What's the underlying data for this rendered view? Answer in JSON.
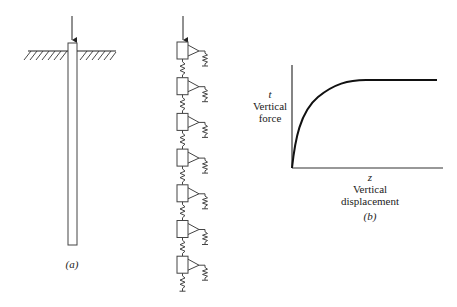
{
  "figure_a": {
    "label": "(a)",
    "description": "Pile driven into ground under vertical load"
  },
  "figure_model": {
    "description": "Pile modeled as segments connected by axial springs with t-z soil springs",
    "segment_count": 7
  },
  "figure_b": {
    "label": "(b)",
    "y_symbol": "t",
    "y_label_line1": "Vertical",
    "y_label_line2": "force",
    "x_symbol": "z",
    "x_label_line1": "Vertical",
    "x_label_line2": "displacement"
  },
  "chart_data": {
    "type": "line",
    "title": "",
    "xlabel": "z Vertical displacement",
    "ylabel": "t Vertical force",
    "series": [
      {
        "name": "t-z curve",
        "x": [
          0,
          0.05,
          0.1,
          0.2,
          0.3,
          0.4,
          0.5,
          0.6,
          1.0
        ],
        "y": [
          0,
          0.35,
          0.55,
          0.78,
          0.91,
          0.98,
          1.0,
          1.0,
          1.0
        ]
      }
    ],
    "grid": false,
    "legend": null
  },
  "colors": {
    "line": "#222222",
    "background": "#ffffff"
  }
}
